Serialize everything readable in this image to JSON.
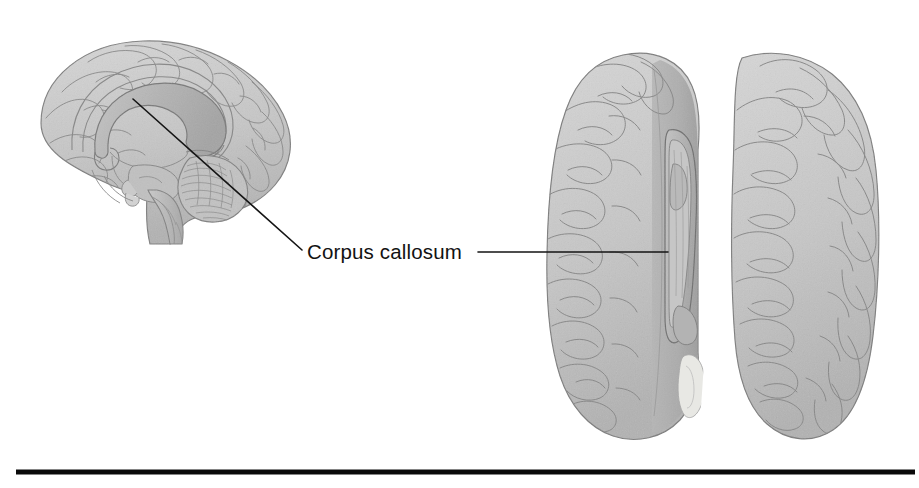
{
  "figure": {
    "kind": "anatomical-illustration",
    "render_style": "grayscale medical line drawing",
    "background_color": "#ffffff",
    "width": 919,
    "height": 488
  },
  "annotations": {
    "corpus_callosum": {
      "label": "Corpus callosum",
      "text_color": "#121212",
      "font_size_px": 20.5,
      "text_x": 307,
      "text_baseline_y": 259,
      "leader_left": {
        "from_x": 302,
        "from_y": 250,
        "to_x": 133,
        "to_y": 99,
        "color": "#151515",
        "width": 1.6
      },
      "leader_right": {
        "from_x": 478,
        "from_y": 252,
        "to_x": 668,
        "to_y": 252,
        "color": "#151515",
        "width": 1.6
      }
    }
  },
  "panels": {
    "sagittal": {
      "name": "Midsagittal section of brain",
      "view": "medial / midsagittal",
      "bounds": {
        "x": 38,
        "y": 40,
        "width": 252,
        "height": 205
      },
      "structures": [
        "cerebral cortex",
        "corpus callosum",
        "cingulate gyrus",
        "fornix",
        "thalamus",
        "midbrain",
        "pons",
        "medulla oblongata",
        "cerebellum",
        "spinal cord"
      ]
    },
    "superior": {
      "name": "Superior view of brain with left hemisphere dissected",
      "view": "superior / dorsal",
      "bounds": {
        "x": 545,
        "y": 50,
        "width": 334,
        "height": 392
      },
      "structures": [
        "left cerebral hemisphere (partially dissected)",
        "right cerebral hemisphere",
        "corpus callosum (exposed)",
        "longitudinal fissure",
        "lateral ventricle"
      ]
    }
  },
  "colors": {
    "brain_fill_light": "#cdcdcd",
    "brain_fill_mid": "#bcbcbc",
    "brain_fill_dark": "#a9a9a9",
    "callosum_fill": "#b4b4b4",
    "callosum_inner": "#c9c9c9",
    "sulcus_stroke": "#8a8a8a",
    "outline_stroke": "#7c7c7c",
    "highlight_fill": "#e4e4e0",
    "rule_color": "#0a0a0a",
    "label_color": "#121212"
  },
  "footer_rule": {
    "name": "horizontal-rule",
    "x1": 16,
    "x2": 915,
    "y": 472,
    "thickness": 5,
    "color": "#0a0a0a"
  }
}
